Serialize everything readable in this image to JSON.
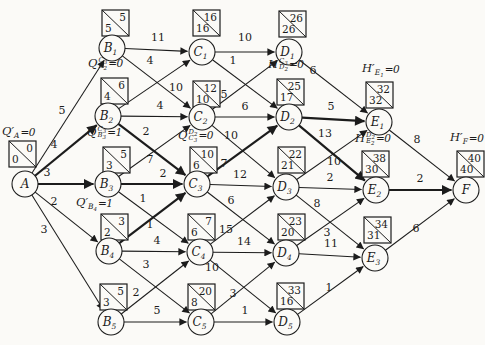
{
  "diagram": {
    "background": "#fbfaf7",
    "ink": "#1c1c1c",
    "node_radius": 13,
    "box_w": 27,
    "box_h": 26,
    "nodes": [
      {
        "id": "A",
        "letter": "A",
        "digit": "",
        "x": 25,
        "y": 184,
        "box": {
          "x": 9,
          "y": 141,
          "top": "0",
          "bottom": "0"
        },
        "formula": {
          "base": "Q",
          "prime": true,
          "sup_letter": "",
          "sup_digit": "",
          "sub_letter": "A",
          "sub_digit": "",
          "value": "=0",
          "x": 2,
          "y": 126
        }
      },
      {
        "id": "B1",
        "letter": "B",
        "digit": "1",
        "x": 112,
        "y": 48,
        "box": {
          "x": 102,
          "y": 10,
          "top": "5",
          "bottom": "5"
        }
      },
      {
        "id": "B2",
        "letter": "B",
        "digit": "2",
        "x": 108,
        "y": 116,
        "box": {
          "x": 101,
          "y": 78,
          "top": "6",
          "bottom": "4"
        },
        "formula": {
          "base": "Q",
          "prime": false,
          "sup_letter": "C",
          "sup_digit": "3",
          "sub_letter": "B",
          "sub_digit": "2",
          "value": "=0",
          "x": 88,
          "y": 57
        }
      },
      {
        "id": "B3",
        "letter": "B",
        "digit": "3",
        "x": 108,
        "y": 184,
        "box": {
          "x": 103,
          "y": 147,
          "top": "5",
          "bottom": "3"
        },
        "formula": {
          "base": "Q",
          "prime": false,
          "sup_letter": "C",
          "sup_digit": "3",
          "sub_letter": "B",
          "sub_digit": "3",
          "value": "=1",
          "x": 87,
          "y": 126
        }
      },
      {
        "id": "B4",
        "letter": "B",
        "digit": "4",
        "x": 109,
        "y": 251,
        "box": {
          "x": 101,
          "y": 214,
          "top": "3",
          "bottom": "2"
        },
        "formula": {
          "base": "Q",
          "prime": true,
          "sup_letter": "",
          "sup_digit": "",
          "sub_letter": "B",
          "sub_digit": "4",
          "value": "=1",
          "x": 76,
          "y": 197
        }
      },
      {
        "id": "B5",
        "letter": "B",
        "digit": "5",
        "x": 111,
        "y": 322,
        "box": {
          "x": 100,
          "y": 284,
          "top": "5",
          "bottom": "3"
        }
      },
      {
        "id": "C1",
        "letter": "C",
        "digit": "1",
        "x": 202,
        "y": 52,
        "box": {
          "x": 193,
          "y": 10,
          "top": "16",
          "bottom": "16"
        }
      },
      {
        "id": "C2",
        "letter": "C",
        "digit": "2",
        "x": 202,
        "y": 117,
        "box": {
          "x": 193,
          "y": 81,
          "top": "12",
          "bottom": "10"
        }
      },
      {
        "id": "C3",
        "letter": "C",
        "digit": "3",
        "x": 197,
        "y": 184,
        "box": {
          "x": 190,
          "y": 147,
          "top": "10",
          "bottom": "6"
        },
        "formula": {
          "base": "Q",
          "prime": false,
          "sup_letter": "D",
          "sup_digit": "2",
          "sub_letter": "C",
          "sub_digit": "3",
          "value": "=0",
          "x": 178,
          "y": 129
        }
      },
      {
        "id": "C4",
        "letter": "C",
        "digit": "4",
        "x": 200,
        "y": 252,
        "box": {
          "x": 188,
          "y": 214,
          "top": "7",
          "bottom": "6"
        }
      },
      {
        "id": "C5",
        "letter": "C",
        "digit": "5",
        "x": 201,
        "y": 322,
        "box": {
          "x": 188,
          "y": 284,
          "top": "20",
          "bottom": "8"
        }
      },
      {
        "id": "D1",
        "letter": "D",
        "digit": "1",
        "x": 289,
        "y": 52,
        "box": {
          "x": 279,
          "y": 11,
          "top": "26",
          "bottom": "26"
        }
      },
      {
        "id": "D2",
        "letter": "D",
        "digit": "2",
        "x": 289,
        "y": 117,
        "box": {
          "x": 277,
          "y": 79,
          "top": "25",
          "bottom": "17"
        },
        "formula": {
          "base": "H",
          "prime": false,
          "sup_letter": "C",
          "sup_digit": "3",
          "sub_letter": "D",
          "sub_digit": "2",
          "value": "=0",
          "x": 268,
          "y": 58
        }
      },
      {
        "id": "D3",
        "letter": "D",
        "digit": "3",
        "x": 286,
        "y": 187,
        "box": {
          "x": 278,
          "y": 147,
          "top": "22",
          "bottom": "21"
        }
      },
      {
        "id": "D4",
        "letter": "D",
        "digit": "4",
        "x": 286,
        "y": 253,
        "box": {
          "x": 278,
          "y": 214,
          "top": "23",
          "bottom": "20"
        }
      },
      {
        "id": "D5",
        "letter": "D",
        "digit": "5",
        "x": 287,
        "y": 322,
        "box": {
          "x": 277,
          "y": 283,
          "top": "33",
          "bottom": "16"
        }
      },
      {
        "id": "E1",
        "letter": "E",
        "digit": "1",
        "x": 379,
        "y": 122,
        "box": {
          "x": 366,
          "y": 82,
          "top": "32",
          "bottom": "32"
        },
        "formula": {
          "base": "H",
          "prime": true,
          "sup_letter": "",
          "sup_digit": "",
          "sub_letter": "E",
          "sub_digit": "1",
          "value": "=0",
          "x": 362,
          "y": 63
        }
      },
      {
        "id": "E2",
        "letter": "E",
        "digit": "2",
        "x": 376,
        "y": 190,
        "box": {
          "x": 362,
          "y": 151,
          "top": "38",
          "bottom": "30"
        },
        "formula": {
          "base": "H",
          "prime": false,
          "sup_letter": "D",
          "sup_digit": "2",
          "sub_letter": "E",
          "sub_digit": "2",
          "value": "=0",
          "x": 355,
          "y": 132
        }
      },
      {
        "id": "E3",
        "letter": "E",
        "digit": "3",
        "x": 375,
        "y": 258,
        "box": {
          "x": 364,
          "y": 217,
          "top": "34",
          "bottom": "31"
        }
      },
      {
        "id": "F",
        "letter": "F",
        "digit": "",
        "x": 466,
        "y": 190,
        "box": {
          "x": 457,
          "y": 151,
          "top": "40",
          "bottom": "40"
        },
        "formula": {
          "base": "H",
          "prime": true,
          "sup_letter": "",
          "sup_digit": "",
          "sub_letter": "F",
          "sub_digit": "",
          "value": "=0",
          "x": 450,
          "y": 132
        }
      }
    ],
    "edges": [
      {
        "from": "A",
        "to": "B1",
        "label": "5",
        "bold": false,
        "lx": 62,
        "ly": 114
      },
      {
        "from": "A",
        "to": "B2",
        "label": "4",
        "bold": true,
        "lx": 54,
        "ly": 148
      },
      {
        "from": "A",
        "to": "B3",
        "label": "3",
        "bold": true,
        "lx": 47,
        "ly": 176
      },
      {
        "from": "A",
        "to": "B4",
        "label": "2",
        "bold": false,
        "lx": 54,
        "ly": 205
      },
      {
        "from": "A",
        "to": "B5",
        "label": "3",
        "bold": false,
        "lx": 44,
        "ly": 233
      },
      {
        "from": "B1",
        "to": "C1",
        "label": "11",
        "bold": false,
        "lx": 158,
        "ly": 41
      },
      {
        "from": "B1",
        "to": "C2",
        "label": "4",
        "bold": false,
        "lx": 150,
        "ly": 64
      },
      {
        "from": "B2",
        "to": "C1",
        "label": "10",
        "bold": false,
        "lx": 176,
        "ly": 91
      },
      {
        "from": "B2",
        "to": "C2",
        "label": "4",
        "bold": false,
        "lx": 160,
        "ly": 109
      },
      {
        "from": "B2",
        "to": "C3",
        "label": "2",
        "bold": true,
        "lx": 146,
        "ly": 135
      },
      {
        "from": "B3",
        "to": "C2",
        "label": "7",
        "bold": false,
        "lx": 150,
        "ly": 163
      },
      {
        "from": "B3",
        "to": "C3",
        "label": "2",
        "bold": true,
        "lx": 163,
        "ly": 177
      },
      {
        "from": "B3",
        "to": "C4",
        "label": "1",
        "bold": false,
        "lx": 143,
        "ly": 202
      },
      {
        "from": "B4",
        "to": "C3",
        "label": "1",
        "bold": true,
        "lx": 150,
        "ly": 228
      },
      {
        "from": "B4",
        "to": "C4",
        "label": "4",
        "bold": false,
        "lx": 157,
        "ly": 244
      },
      {
        "from": "B4",
        "to": "C5",
        "label": "3",
        "bold": false,
        "lx": 146,
        "ly": 268
      },
      {
        "from": "B5",
        "to": "C4",
        "label": "2",
        "bold": false,
        "lx": 136,
        "ly": 296
      },
      {
        "from": "B5",
        "to": "C5",
        "label": "5",
        "bold": false,
        "lx": 157,
        "ly": 314
      },
      {
        "from": "C1",
        "to": "D1",
        "label": "10",
        "bold": false,
        "lx": 245,
        "ly": 41
      },
      {
        "from": "C1",
        "to": "D2",
        "label": "1",
        "bold": false,
        "lx": 233,
        "ly": 64
      },
      {
        "from": "C2",
        "to": "D1",
        "label": "5",
        "bold": false,
        "lx": 224,
        "ly": 98
      },
      {
        "from": "C2",
        "to": "D2",
        "label": "6",
        "bold": false,
        "lx": 245,
        "ly": 110
      },
      {
        "from": "C2",
        "to": "D3",
        "label": "10",
        "bold": false,
        "lx": 231,
        "ly": 139
      },
      {
        "from": "C3",
        "to": "D2",
        "label": "7",
        "bold": true,
        "lx": 224,
        "ly": 167
      },
      {
        "from": "C3",
        "to": "D3",
        "label": "12",
        "bold": false,
        "lx": 240,
        "ly": 178
      },
      {
        "from": "C3",
        "to": "D4",
        "label": "6",
        "bold": false,
        "lx": 231,
        "ly": 204
      },
      {
        "from": "C4",
        "to": "D3",
        "label": "15",
        "bold": false,
        "lx": 226,
        "ly": 233
      },
      {
        "from": "C4",
        "to": "D4",
        "label": "14",
        "bold": false,
        "lx": 244,
        "ly": 245
      },
      {
        "from": "C4",
        "to": "D5",
        "label": "10",
        "bold": false,
        "lx": 212,
        "ly": 271
      },
      {
        "from": "C5",
        "to": "D4",
        "label": "3",
        "bold": false,
        "lx": 233,
        "ly": 297
      },
      {
        "from": "C5",
        "to": "D5",
        "label": "1",
        "bold": false,
        "lx": 245,
        "ly": 314
      },
      {
        "from": "D1",
        "to": "E1",
        "label": "6",
        "bold": false,
        "lx": 313,
        "ly": 74
      },
      {
        "from": "D2",
        "to": "E1",
        "label": "5",
        "bold": true,
        "lx": 331,
        "ly": 110
      },
      {
        "from": "D2",
        "to": "E2",
        "label": "13",
        "bold": true,
        "lx": 325,
        "ly": 137
      },
      {
        "from": "D3",
        "to": "E1",
        "label": "10",
        "bold": false,
        "lx": 334,
        "ly": 165
      },
      {
        "from": "D3",
        "to": "E2",
        "label": "2",
        "bold": false,
        "lx": 330,
        "ly": 181
      },
      {
        "from": "D3",
        "to": "E3",
        "label": "8",
        "bold": false,
        "lx": 317,
        "ly": 207
      },
      {
        "from": "D4",
        "to": "E2",
        "label": "3",
        "bold": false,
        "lx": 327,
        "ly": 236
      },
      {
        "from": "D4",
        "to": "E3",
        "label": "11",
        "bold": false,
        "lx": 331,
        "ly": 247
      },
      {
        "from": "D5",
        "to": "E3",
        "label": "1",
        "bold": false,
        "lx": 329,
        "ly": 291
      },
      {
        "from": "E1",
        "to": "F",
        "label": "8",
        "bold": false,
        "lx": 417,
        "ly": 143
      },
      {
        "from": "E2",
        "to": "F",
        "label": "2",
        "bold": true,
        "lx": 420,
        "ly": 182
      },
      {
        "from": "E3",
        "to": "F",
        "label": "6",
        "bold": false,
        "lx": 416,
        "ly": 232
      }
    ]
  }
}
